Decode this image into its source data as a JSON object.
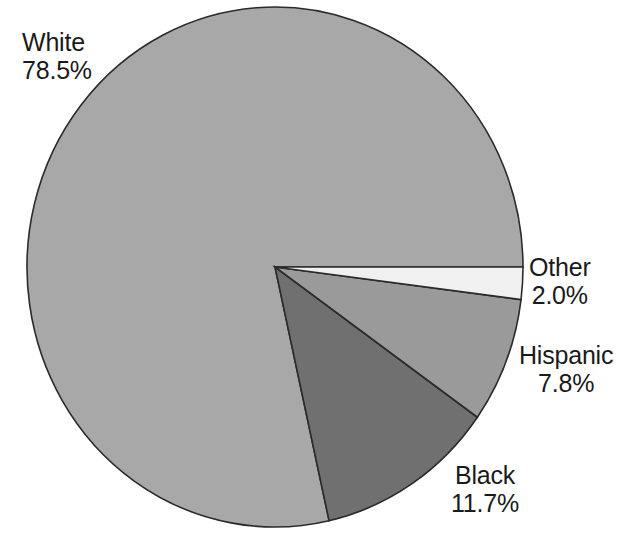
{
  "figure": {
    "background_color": "#ffffff",
    "width": 635,
    "height": 543
  },
  "chart_data": {
    "type": "pie",
    "title": "",
    "subtitle": "",
    "xlabel": "",
    "ylabel": "",
    "legend_position": "none",
    "grid": false,
    "labels_inline": true,
    "start_angle_deg": 0,
    "direction": "clockwise",
    "categories": [
      "White",
      "Black",
      "Hispanic",
      "Other"
    ],
    "values": [
      78.5,
      11.7,
      7.8,
      2.0
    ],
    "value_unit": "%",
    "slices": [
      {
        "name": "White",
        "value": 78.5,
        "value_text": "78.5%",
        "color": "#a8a8a8",
        "start_deg": 77.4,
        "end_deg": 360.0,
        "label_position": "top-left"
      },
      {
        "name": "Black",
        "value": 11.7,
        "value_text": "11.7%",
        "color": "#707070",
        "start_deg": 35.3,
        "end_deg": 77.4,
        "label_position": "bottom-right"
      },
      {
        "name": "Hispanic",
        "value": 7.8,
        "value_text": "7.8%",
        "color": "#9a9a9a",
        "start_deg": 7.2,
        "end_deg": 35.3,
        "label_position": "right-lower"
      },
      {
        "name": "Other",
        "value": 2.0,
        "value_text": "2.0%",
        "color": "#f0f0f0",
        "start_deg": 0.0,
        "end_deg": 7.2,
        "label_position": "right-upper"
      }
    ],
    "outline_color": "#2b2b2b",
    "geometry": {
      "center_x": 275,
      "center_y": 267,
      "radius_x": 248,
      "radius_y": 260
    }
  },
  "labels": {
    "white": {
      "name": "White",
      "value": "78.5%"
    },
    "black": {
      "name": "Black",
      "value": "11.7%"
    },
    "hispanic": {
      "name": "Hispanic",
      "value": "7.8%"
    },
    "other": {
      "name": "Other",
      "value": "2.0%"
    }
  }
}
